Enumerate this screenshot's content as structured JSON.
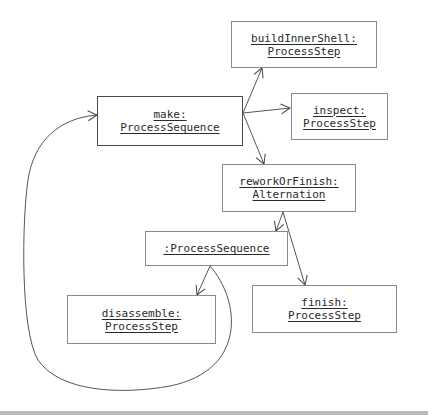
{
  "diagram": {
    "type": "UML object diagram",
    "nodes": [
      {
        "id": "make",
        "line1": "make:",
        "line2": "ProcessSequence"
      },
      {
        "id": "buildInnerShell",
        "line1": "buildInnerShell:",
        "line2": "ProcessStep"
      },
      {
        "id": "inspect",
        "line1": "inspect:",
        "line2": "ProcessStep"
      },
      {
        "id": "reworkOrFinish",
        "line1": "reworkOrFinish:",
        "line2": "Alternation"
      },
      {
        "id": "processSequence",
        "line1": ":ProcessSequence",
        "line2": ""
      },
      {
        "id": "disassemble",
        "line1": "disassemble:",
        "line2": "ProcessStep"
      },
      {
        "id": "finish",
        "line1": "finish:",
        "line2": "ProcessStep"
      }
    ],
    "edges": [
      {
        "from": "make",
        "to": "buildInnerShell"
      },
      {
        "from": "make",
        "to": "inspect"
      },
      {
        "from": "make",
        "to": "reworkOrFinish"
      },
      {
        "from": "reworkOrFinish",
        "to": "processSequence"
      },
      {
        "from": "reworkOrFinish",
        "to": "finish"
      },
      {
        "from": "processSequence",
        "to": "disassemble"
      },
      {
        "from": "processSequence",
        "to": "make",
        "style": "loop-back curve"
      }
    ]
  }
}
